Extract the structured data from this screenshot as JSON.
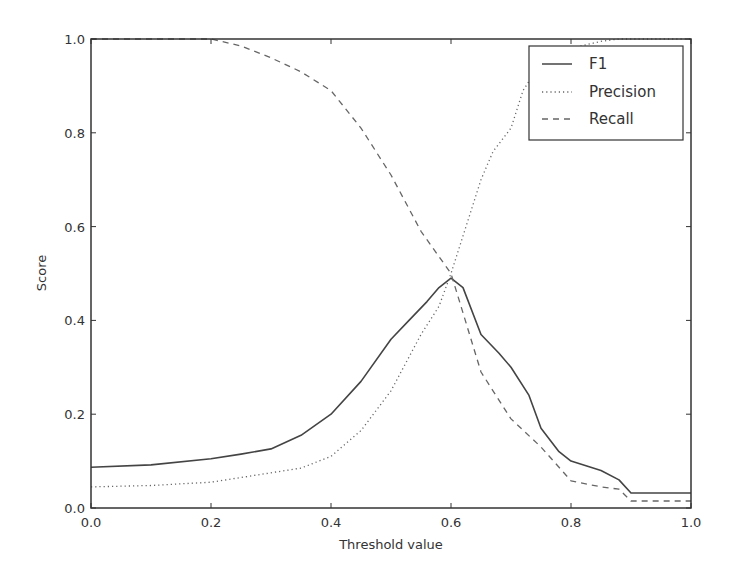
{
  "chart_data": {
    "type": "line",
    "title": "",
    "xlabel": "Threshold value",
    "ylabel": "Score",
    "xlim": [
      0.0,
      1.0
    ],
    "ylim": [
      0.0,
      1.0
    ],
    "x_ticks": [
      "0.0",
      "0.2",
      "0.4",
      "0.6",
      "0.8",
      "1.0"
    ],
    "y_ticks": [
      "0.0",
      "0.2",
      "0.4",
      "0.6",
      "0.8",
      "1.0"
    ],
    "grid": false,
    "legend_position": "upper right",
    "series": [
      {
        "name": "F1",
        "style": "solid",
        "color": "#444444",
        "x": [
          0.0,
          0.1,
          0.2,
          0.25,
          0.3,
          0.35,
          0.4,
          0.45,
          0.5,
          0.53,
          0.56,
          0.58,
          0.6,
          0.62,
          0.65,
          0.68,
          0.7,
          0.73,
          0.75,
          0.78,
          0.8,
          0.85,
          0.88,
          0.9,
          0.95,
          1.0
        ],
        "y": [
          0.087,
          0.092,
          0.105,
          0.115,
          0.126,
          0.155,
          0.2,
          0.27,
          0.36,
          0.4,
          0.44,
          0.47,
          0.49,
          0.47,
          0.37,
          0.33,
          0.3,
          0.24,
          0.17,
          0.12,
          0.1,
          0.08,
          0.06,
          0.032,
          0.032,
          0.032
        ]
      },
      {
        "name": "Precision",
        "style": "dotted",
        "color": "#666666",
        "x": [
          0.0,
          0.1,
          0.2,
          0.25,
          0.3,
          0.35,
          0.4,
          0.45,
          0.5,
          0.55,
          0.58,
          0.6,
          0.62,
          0.65,
          0.67,
          0.7,
          0.72,
          0.75,
          0.8,
          0.85,
          0.88,
          0.9,
          1.0
        ],
        "y": [
          0.045,
          0.048,
          0.055,
          0.065,
          0.075,
          0.085,
          0.11,
          0.165,
          0.25,
          0.37,
          0.43,
          0.5,
          0.58,
          0.7,
          0.76,
          0.81,
          0.89,
          0.95,
          0.98,
          0.995,
          1.0,
          1.0,
          1.0
        ]
      },
      {
        "name": "Recall",
        "style": "dashed",
        "color": "#666666",
        "x": [
          0.0,
          0.1,
          0.2,
          0.25,
          0.3,
          0.35,
          0.4,
          0.45,
          0.5,
          0.55,
          0.6,
          0.65,
          0.7,
          0.75,
          0.8,
          0.85,
          0.88,
          0.9,
          0.95,
          1.0
        ],
        "y": [
          1.0,
          1.0,
          1.0,
          0.985,
          0.96,
          0.93,
          0.89,
          0.81,
          0.71,
          0.59,
          0.5,
          0.29,
          0.19,
          0.13,
          0.058,
          0.045,
          0.04,
          0.015,
          0.015,
          0.015
        ]
      }
    ]
  },
  "legend": {
    "items": [
      {
        "label": "F1",
        "style": "solid"
      },
      {
        "label": "Precision",
        "style": "dotted"
      },
      {
        "label": "Recall",
        "style": "dashed"
      }
    ]
  }
}
